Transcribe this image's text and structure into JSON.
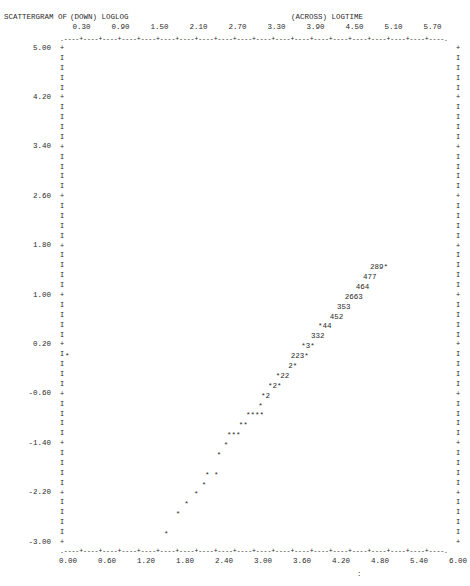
{
  "header": {
    "title": "SCATTERGRAM OF",
    "down_label": "(DOWN) LOGLOG",
    "across_label": "(ACROSS) LOGTIME"
  },
  "chart_data": {
    "type": "scatter",
    "xlabel": "LOGTIME",
    "ylabel": "LOGLOG",
    "xlim": [
      0.0,
      6.0
    ],
    "ylim": [
      -3.0,
      5.0
    ],
    "grid": false,
    "legend": "none",
    "x_ticks_top": [
      "0.30",
      "0.90",
      "1.50",
      "2.10",
      "2.70",
      "3.30",
      "3.90",
      "4.50",
      "5.10",
      "5.70"
    ],
    "x_ticks_bottom": [
      "0.00",
      "0.60",
      "1.20",
      "1.80",
      "2.40",
      "3.00",
      "3.60",
      "4.20",
      "4.80",
      "5.40",
      "6.00"
    ],
    "y_ticks": [
      "5.00",
      "4.20",
      "3.40",
      "2.60",
      "1.80",
      "1.00",
      "0.20",
      "-0.60",
      "-1.40",
      "-2.20",
      "-3.00"
    ],
    "rows": [
      {
        "y": 1.45,
        "x": 4.74,
        "text": "289*"
      },
      {
        "y": 1.29,
        "x": 4.63,
        "text": "477"
      },
      {
        "y": 1.13,
        "x": 4.52,
        "text": "464"
      },
      {
        "y": 0.97,
        "x": 4.35,
        "text": "2663"
      },
      {
        "y": 0.81,
        "x": 4.23,
        "text": "353"
      },
      {
        "y": 0.65,
        "x": 4.12,
        "text": "452"
      },
      {
        "y": 0.49,
        "x": 3.94,
        "text": "*44"
      },
      {
        "y": 0.33,
        "x": 3.83,
        "text": "332"
      },
      {
        "y": 0.17,
        "x": 3.68,
        "text": "*3*"
      },
      {
        "y": 0.01,
        "x": 3.52,
        "text": "223*"
      },
      {
        "y": -0.15,
        "x": 3.48,
        "text": "2*"
      },
      {
        "y": -0.31,
        "x": 3.29,
        "text": "*22"
      },
      {
        "y": -0.47,
        "x": 3.17,
        "text": "*2*"
      },
      {
        "y": -0.63,
        "x": 3.06,
        "text": "*2"
      },
      {
        "y": -0.79,
        "x": 3.02,
        "text": "*"
      },
      {
        "y": -0.95,
        "x": 2.83,
        "text": "****"
      },
      {
        "y": -1.11,
        "x": 2.72,
        "text": "**"
      },
      {
        "y": -1.27,
        "x": 2.54,
        "text": "***"
      },
      {
        "y": -1.43,
        "x": 2.49,
        "text": "*"
      },
      {
        "y": -1.59,
        "x": 2.38,
        "text": "*"
      },
      {
        "y": -1.91,
        "x": 2.2,
        "text": "* *"
      },
      {
        "y": -2.07,
        "x": 2.15,
        "text": "*"
      },
      {
        "y": -2.23,
        "x": 2.03,
        "text": "*"
      },
      {
        "y": -2.39,
        "x": 1.88,
        "text": "*"
      },
      {
        "y": -2.55,
        "x": 1.75,
        "text": "*"
      },
      {
        "y": -2.87,
        "x": 1.57,
        "text": "*"
      }
    ],
    "edge_points": [
      {
        "y": 0.01,
        "x": 0.0,
        "text": "*"
      }
    ],
    "note": "Digits denote count of overlapping cases at that character cell; * denotes a single case."
  },
  "footer": {
    "mark": ":"
  }
}
